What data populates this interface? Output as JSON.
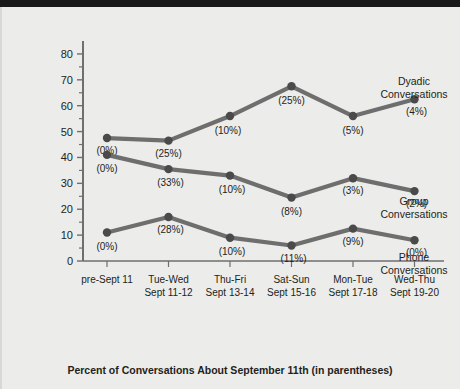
{
  "chart_data": {
    "type": "line",
    "title": "",
    "xlabel": "Percent of Conversations About September 11th (in parentheses)",
    "ylabel": "Percent of Total Conversations",
    "categories": [
      "pre-Sept 11",
      "Tue-Wed",
      "Thu-Fri",
      "Sat-Sun",
      "Mon-Tue",
      "Wed-Thu"
    ],
    "category_sublabels": [
      "",
      "Sept 11-12",
      "Sept 13-14",
      "Sept 15-16",
      "Sept 17-18",
      "Sept 19-20"
    ],
    "ylim": [
      0,
      85
    ],
    "yticks": [
      0,
      10,
      20,
      30,
      40,
      50,
      60,
      70,
      80
    ],
    "yminorticks": [
      5,
      15,
      25,
      35,
      45,
      55,
      65,
      75
    ],
    "grid": false,
    "legend_position": "right-inline",
    "series": [
      {
        "name": "Dyadic Conversations",
        "values": [
          47.5,
          46.5,
          56,
          67.5,
          56,
          62.5
        ],
        "point_labels": [
          "(0%)",
          "(25%)",
          "(10%)",
          "(25%)",
          "(5%)",
          "(4%)"
        ],
        "color": "#6e6e6e"
      },
      {
        "name": "Group Conversations",
        "values": [
          41,
          35.5,
          33,
          24.5,
          32,
          27
        ],
        "point_labels": [
          "(0%)",
          "(33%)",
          "(10%)",
          "(8%)",
          "(3%)",
          "(2%)"
        ],
        "color": "#6e6e6e"
      },
      {
        "name": "Phone Conversations",
        "values": [
          11,
          17,
          9,
          6,
          12.5,
          8
        ],
        "point_labels": [
          "(0%)",
          "(28%)",
          "(10%)",
          "(11%)",
          "(9%)",
          "(0%)"
        ],
        "color": "#6e6e6e"
      }
    ],
    "series_label_lines": [
      [
        "Dyadic",
        "Conversations"
      ],
      [
        "Group",
        "Conversations"
      ],
      [
        "Phone",
        "Conversations"
      ]
    ],
    "colors": {
      "background": "#ececea",
      "line": "#6e6e6e",
      "marker": "#4a4a4a",
      "axis": "#6f6f6f",
      "text": "#231f20",
      "topbar": "#1a1a1a"
    }
  }
}
